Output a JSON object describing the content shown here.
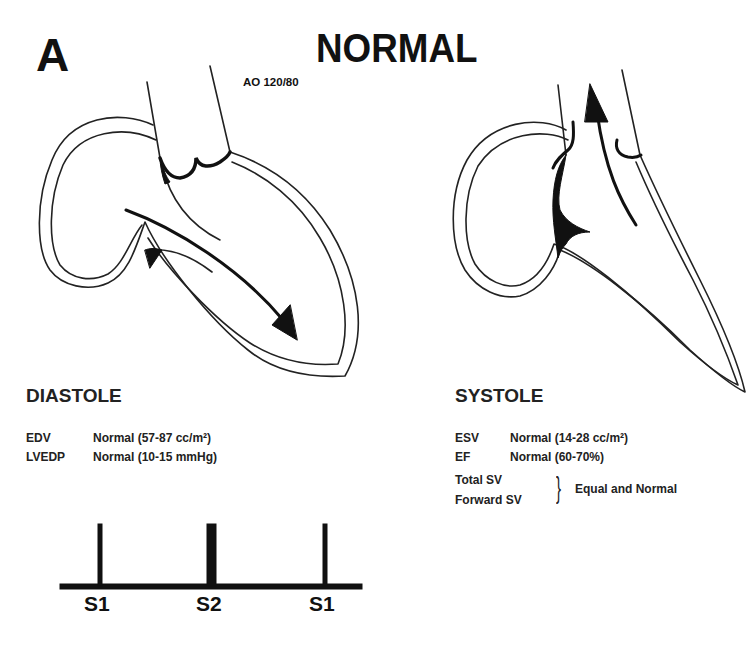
{
  "figure": {
    "panel_letter": "A",
    "title": "NORMAL",
    "aortic_pressure_label": "AO 120/80"
  },
  "diastole": {
    "heading": "DIASTOLE",
    "rows": [
      {
        "key": "EDV",
        "value": "Normal (57-87 cc/m²)"
      },
      {
        "key": "LVEDP",
        "value": "Normal (10-15 mmHg)"
      }
    ]
  },
  "systole": {
    "heading": "SYSTOLE",
    "rows": [
      {
        "key": "ESV",
        "value": "Normal (14-28 cc/m²)"
      },
      {
        "key": "EF",
        "value": "Normal (60-70%)"
      }
    ],
    "grouped_keys": [
      "Total SV",
      "Forward SV"
    ],
    "grouped_value": "Equal and Normal",
    "brace": "}"
  },
  "heart_sounds": {
    "labels": [
      "S1",
      "S2",
      "S1"
    ]
  },
  "colors": {
    "ink": "#111111",
    "background": "#ffffff"
  }
}
